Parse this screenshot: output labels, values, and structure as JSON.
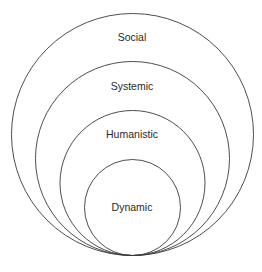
{
  "diagram": {
    "type": "nested-tangent-circles",
    "stroke_color": "#3a3a3a",
    "layers": [
      {
        "label": "Social",
        "cx": 132.5,
        "cy": 134.5,
        "r": 121,
        "label_y": 39
      },
      {
        "label": "Systemic",
        "cx": 132.5,
        "cy": 158.5,
        "r": 97,
        "label_y": 88
      },
      {
        "label": "Humanistic",
        "cx": 132.5,
        "cy": 183,
        "r": 72.5,
        "label_y": 136
      },
      {
        "label": "Dynamic",
        "cx": 132.5,
        "cy": 207.5,
        "r": 48,
        "label_y": 211
      }
    ]
  }
}
